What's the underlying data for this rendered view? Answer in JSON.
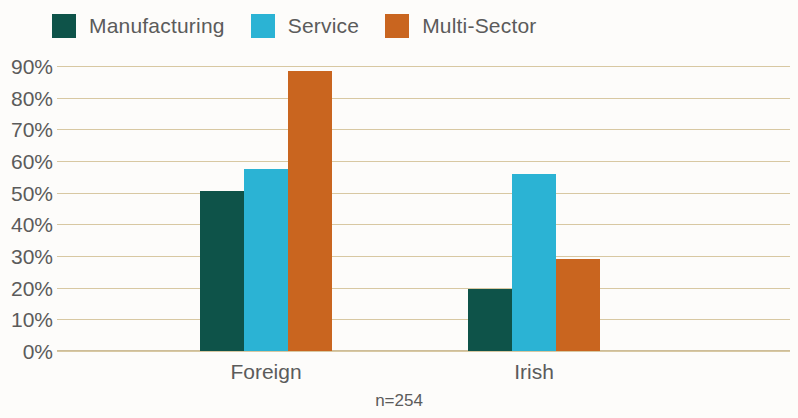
{
  "chart_data": {
    "type": "bar",
    "title": "",
    "subtitle": "",
    "xlabel": "",
    "ylabel": "",
    "categories": [
      "Foreign",
      "Irish"
    ],
    "series": [
      {
        "name": "Manufacturing",
        "color": "#0e5349",
        "values": [
          50.5,
          19.5
        ]
      },
      {
        "name": "Service",
        "color": "#2bb3d4",
        "values": [
          57.5,
          56.0
        ]
      },
      {
        "name": "Multi-Sector",
        "color": "#c9651f",
        "values": [
          88.5,
          29.0
        ]
      }
    ],
    "ylim": [
      0,
      90
    ],
    "ytick_values": [
      0,
      10,
      20,
      30,
      40,
      50,
      60,
      70,
      80,
      90
    ],
    "ytick_labels": [
      "0%",
      "10%",
      "20%",
      "30%",
      "40%",
      "50%",
      "60%",
      "70%",
      "80%",
      "90%"
    ],
    "grid": true,
    "grid_color": "#d8c8a2",
    "legend_position": "top-left",
    "annotations": [
      "n=254"
    ],
    "background_color": "#fdfcfa",
    "text_color": "#5b5b5b"
  },
  "legend": {
    "items": [
      {
        "label": "Manufacturing",
        "color": "#0e5349"
      },
      {
        "label": "Service",
        "color": "#2bb3d4"
      },
      {
        "label": "Multi-Sector",
        "color": "#c9651f"
      }
    ]
  },
  "axis": {
    "y_labels": [
      "90%",
      "80%",
      "70%",
      "60%",
      "50%",
      "40%",
      "30%",
      "20%",
      "10%",
      "0%"
    ],
    "x_labels": [
      "Foreign",
      "Irish"
    ]
  },
  "footer": {
    "sample_size": "n=254"
  }
}
